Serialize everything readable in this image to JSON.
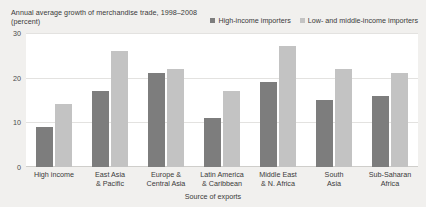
{
  "chart_data": {
    "type": "bar",
    "title": "Annual average growth of merchandise trade, 1998–2008 (percent)",
    "xlabel": "Source of exports",
    "ylabel": "",
    "ylim": [
      0,
      30
    ],
    "yticks": [
      0,
      10,
      20,
      30
    ],
    "ytick_labels": [
      "0",
      "10",
      "20",
      "30"
    ],
    "grid": true,
    "legend_position": "top-right",
    "categories": [
      "High income",
      "East Asia\n& Pacific",
      "Europe &\nCentral Asia",
      "Latin America\n& Caribbean",
      "Middle East\n& N. Africa",
      "South\nAsia",
      "Sub-Saharan\nAfrica"
    ],
    "category_lines": [
      [
        "High income",
        ""
      ],
      [
        "East Asia",
        "& Pacific"
      ],
      [
        "Europe &",
        "Central Asia"
      ],
      [
        "Latin America",
        "& Caribbean"
      ],
      [
        "Middle East",
        "& N. Africa"
      ],
      [
        "South",
        "Asia"
      ],
      [
        "Sub-Saharan",
        "Africa"
      ]
    ],
    "series": [
      {
        "name": "High-income importers",
        "color": "#7d7d7d",
        "values": [
          9,
          17,
          21,
          11,
          19,
          15,
          16
        ]
      },
      {
        "name": "Low- and middle-income importers",
        "color": "#c3c3c3",
        "values": [
          14,
          26,
          22,
          17,
          27,
          22,
          21
        ]
      }
    ]
  },
  "legend": {
    "items": [
      {
        "label": "High-income importers",
        "color": "#7d7d7d"
      },
      {
        "label": "Low- and middle-income importers",
        "color": "#c3c3c3"
      }
    ]
  }
}
